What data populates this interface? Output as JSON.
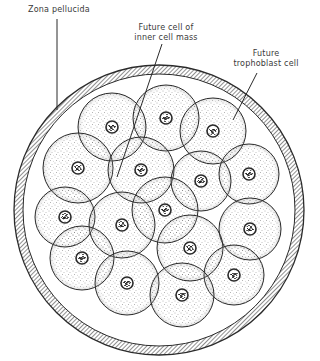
{
  "figure": {
    "colors": {
      "ink": "#2a2a2a",
      "background": "#ffffff",
      "stipple": "#555555"
    },
    "zona": {
      "cx": 159,
      "cy": 210,
      "r_outer": 145,
      "r_inner": 136
    },
    "cells": [
      {
        "cx": 112,
        "cy": 127,
        "r": 34
      },
      {
        "cx": 166,
        "cy": 118,
        "r": 33
      },
      {
        "cx": 213,
        "cy": 131,
        "r": 33
      },
      {
        "cx": 78,
        "cy": 168,
        "r": 35
      },
      {
        "cx": 141,
        "cy": 170,
        "r": 33
      },
      {
        "cx": 201,
        "cy": 181,
        "r": 30
      },
      {
        "cx": 249,
        "cy": 174,
        "r": 30
      },
      {
        "cx": 65,
        "cy": 217,
        "r": 30
      },
      {
        "cx": 165,
        "cy": 210,
        "r": 33
      },
      {
        "cx": 122,
        "cy": 225,
        "r": 33
      },
      {
        "cx": 250,
        "cy": 229,
        "r": 31
      },
      {
        "cx": 82,
        "cy": 258,
        "r": 32
      },
      {
        "cx": 190,
        "cy": 248,
        "r": 33
      },
      {
        "cx": 127,
        "cy": 283,
        "r": 32
      },
      {
        "cx": 234,
        "cy": 275,
        "r": 30
      },
      {
        "cx": 182,
        "cy": 295,
        "r": 32
      }
    ]
  },
  "labels": {
    "zona_pellucida": "Zona pellucida",
    "inner_cell_mass_line1": "Future cell of",
    "inner_cell_mass_line2": "inner cell mass",
    "trophoblast_line1": "Future",
    "trophoblast_line2": "trophoblast cell"
  },
  "leaders": {
    "zona_pellucida": {
      "x1": 57,
      "y1": 19,
      "x2": 57,
      "y2": 110
    },
    "inner_cell_mass": {
      "x1": 162,
      "y1": 44,
      "x2": 117,
      "y2": 177
    },
    "trophoblast": {
      "x1": 257,
      "y1": 73,
      "x2": 233,
      "y2": 120
    }
  }
}
